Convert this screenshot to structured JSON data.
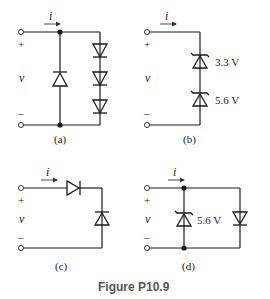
{
  "figure": {
    "caption": "Figure P10.9",
    "circuits": [
      {
        "label": "(a)",
        "current_label": "i",
        "voltage_label": "v",
        "plus": "+",
        "minus": "–",
        "components": [
          "diode (upward, center branch)",
          "diode (downward)",
          "diode (downward)",
          "diode (downward)"
        ]
      },
      {
        "label": "(b)",
        "current_label": "i",
        "voltage_label": "v",
        "plus": "+",
        "minus": "–",
        "zeners": [
          {
            "voltage": "3.3 V"
          },
          {
            "voltage": "5.6 V"
          }
        ]
      },
      {
        "label": "(c)",
        "current_label": "i",
        "voltage_label": "v",
        "plus": "+",
        "minus": "–",
        "components": [
          "diode (series, rightward)",
          "diode (shunt, upward)"
        ]
      },
      {
        "label": "(d)",
        "current_label": "i",
        "voltage_label": "v",
        "plus": "+",
        "minus": "–",
        "zeners": [
          {
            "voltage": "5.6 V"
          }
        ],
        "components": [
          "zener (upward)",
          "diode (downward)"
        ]
      }
    ]
  }
}
